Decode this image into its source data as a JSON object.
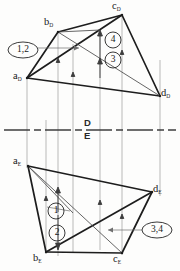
{
  "drawing": {
    "title": "Orthographic two-view projection of tetrahedron with visibility points",
    "type": "descriptive-geometry",
    "line_colors": {
      "object": "#1d1d1d",
      "thin": "#5a5a5a",
      "projector": "#8c8c8c",
      "fold_line": "#444444",
      "label": "#171717"
    },
    "planes": {
      "upper_label": "D",
      "lower_label": "E"
    },
    "vertices_upper": [
      {
        "name": "a-upper",
        "letter": "a",
        "sub": "D",
        "x": 27,
        "y": 78,
        "label_x": 13,
        "label_y": 71
      },
      {
        "name": "b-upper",
        "letter": "b",
        "sub": "D",
        "x": 58,
        "y": 32,
        "label_x": 44,
        "label_y": 17
      },
      {
        "name": "c-upper",
        "letter": "c",
        "sub": "D",
        "x": 122,
        "y": 15,
        "label_x": 113,
        "label_y": 2
      },
      {
        "name": "d-upper",
        "letter": "d",
        "sub": "D",
        "x": 160,
        "y": 96,
        "label_x": 161,
        "label_y": 89
      }
    ],
    "vertices_lower": [
      {
        "name": "a-lower",
        "letter": "a",
        "sub": "E",
        "x": 28,
        "y": 166,
        "label_x": 13,
        "label_y": 157
      },
      {
        "name": "b-lower",
        "letter": "b",
        "sub": "E",
        "x": 46,
        "y": 252,
        "label_x": 34,
        "label_y": 252
      },
      {
        "name": "c-lower",
        "letter": "c",
        "sub": "E",
        "x": 122,
        "y": 253,
        "label_x": 114,
        "label_y": 253
      },
      {
        "name": "d-lower",
        "letter": "d",
        "sub": "E",
        "x": 152,
        "y": 192,
        "label_x": 153,
        "label_y": 185
      }
    ],
    "markers": [
      {
        "name": "marker-1-2",
        "text": "1,2",
        "shape": "ellipse",
        "cx": 23,
        "cy": 50,
        "rx": 15,
        "ry": 8
      },
      {
        "name": "marker-4",
        "text": "4",
        "shape": "circle",
        "cx": 113,
        "cy": 40,
        "r": 8
      },
      {
        "name": "marker-3",
        "text": "3",
        "shape": "circle",
        "cx": 113,
        "cy": 60,
        "r": 8
      },
      {
        "name": "marker-1",
        "text": "1",
        "shape": "circle",
        "cx": 56,
        "cy": 211,
        "r": 8
      },
      {
        "name": "marker-2",
        "text": "2",
        "shape": "circle",
        "cx": 57,
        "cy": 233,
        "r": 8
      },
      {
        "name": "marker-3-4",
        "text": "3,4",
        "shape": "ellipse",
        "cx": 157,
        "cy": 230,
        "rx": 15,
        "ry": 8
      }
    ],
    "fold_line": {
      "y": 130,
      "x_start": 4,
      "x_end": 176
    },
    "projector_lines": [
      {
        "x": 27
      },
      {
        "x": 46
      },
      {
        "x": 58
      },
      {
        "x": 73
      },
      {
        "x": 100
      },
      {
        "x": 122
      },
      {
        "x": 160
      }
    ]
  }
}
